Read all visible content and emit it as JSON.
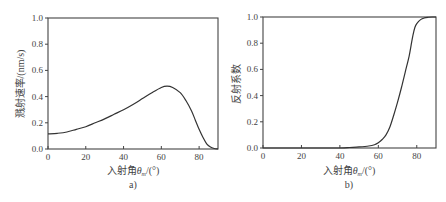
{
  "chart_data": [
    {
      "id": "a",
      "type": "line",
      "caption": "a)",
      "title": "",
      "xlabel": "入射角θm/(°)",
      "xlabel_main": "入射角",
      "xlabel_symbol": "θ",
      "xlabel_sub": "m",
      "xlabel_unit": "/(°)",
      "ylabel": "溅射速率/(nm/s)",
      "xlim": [
        0,
        90
      ],
      "ylim": [
        0,
        1.0
      ],
      "xticks": [
        0,
        20,
        40,
        60,
        80
      ],
      "yticks": [
        "0.0",
        "0.2",
        "0.4",
        "0.6",
        "0.8",
        "1.0"
      ],
      "grid": false,
      "legend": null,
      "series": [
        {
          "name": "溅射速率",
          "x": [
            0,
            5,
            10,
            15,
            20,
            25,
            30,
            35,
            40,
            45,
            50,
            55,
            60,
            63,
            66,
            70,
            73,
            76,
            78,
            80,
            82,
            84,
            86,
            88,
            90
          ],
          "y": [
            0.115,
            0.12,
            0.13,
            0.15,
            0.17,
            0.2,
            0.23,
            0.265,
            0.3,
            0.34,
            0.385,
            0.43,
            0.47,
            0.48,
            0.47,
            0.43,
            0.37,
            0.29,
            0.22,
            0.15,
            0.09,
            0.04,
            0.015,
            0.004,
            0.0
          ]
        }
      ]
    },
    {
      "id": "b",
      "type": "line",
      "caption": "b)",
      "title": "",
      "xlabel": "入射角θm/(°)",
      "xlabel_main": "入射角",
      "xlabel_symbol": "θ",
      "xlabel_sub": "m",
      "xlabel_unit": "/(°)",
      "ylabel": "反射系数",
      "xlim": [
        0,
        90
      ],
      "ylim": [
        0,
        1.0
      ],
      "xticks": [
        0,
        20,
        40,
        60,
        80
      ],
      "yticks": [
        "0.0",
        "0.2",
        "0.4",
        "0.6",
        "0.8",
        "1.0"
      ],
      "grid": false,
      "legend": null,
      "series": [
        {
          "name": "反射系数",
          "x": [
            0,
            20,
            40,
            45,
            50,
            55,
            58,
            60,
            62,
            64,
            66,
            68,
            70,
            72,
            74,
            76,
            77,
            78,
            79,
            80,
            82,
            84,
            86,
            88,
            90
          ],
          "y": [
            0.0,
            0.0,
            0.0,
            0.004,
            0.008,
            0.015,
            0.025,
            0.04,
            0.065,
            0.1,
            0.16,
            0.25,
            0.35,
            0.46,
            0.58,
            0.7,
            0.78,
            0.86,
            0.92,
            0.95,
            0.98,
            0.993,
            0.998,
            1.0,
            1.0
          ]
        }
      ]
    }
  ]
}
